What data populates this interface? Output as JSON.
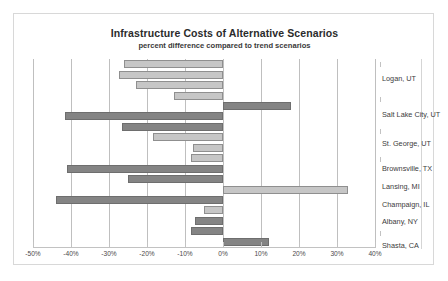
{
  "chart": {
    "title": "Infrastructure Costs of Alternative Scenarios",
    "subtitle": "percent difference compared to trend scenarios"
  },
  "chart_data": {
    "type": "bar",
    "orientation": "horizontal",
    "title": "Infrastructure Costs of Alternative Scenarios",
    "subtitle": "percent difference compared to trend scenarios",
    "xlabel": "",
    "ylabel": "",
    "xlim": [
      -50,
      40
    ],
    "xtick_labels": [
      "-50%",
      "-40%",
      "-30%",
      "-20%",
      "-10%",
      "0%",
      "10%",
      "20%",
      "30%",
      "40%"
    ],
    "xticks": [
      -50,
      -40,
      -30,
      -20,
      -10,
      0,
      10,
      20,
      30,
      40
    ],
    "grid": true,
    "legend": false,
    "categories": [
      "Logan, UT",
      "Salt Lake City, UT",
      "St. George, UT",
      "Brownsville, TX",
      "Lansing, MI",
      "Champaign, IL",
      "Albany, NY",
      "Shasta, CA"
    ],
    "bars": [
      {
        "value": -26.0,
        "style": "light"
      },
      {
        "value": -27.5,
        "style": "light"
      },
      {
        "value": -23.0,
        "style": "light"
      },
      {
        "value": -13.0,
        "style": "light"
      },
      {
        "value": 18.0,
        "style": "dark"
      },
      {
        "value": -41.5,
        "style": "dark"
      },
      {
        "value": -26.5,
        "style": "dark"
      },
      {
        "value": -18.5,
        "style": "light"
      },
      {
        "value": -8.0,
        "style": "light"
      },
      {
        "value": -8.5,
        "style": "light"
      },
      {
        "value": -41.0,
        "style": "dark"
      },
      {
        "value": -25.0,
        "style": "dark"
      },
      {
        "value": 33.0,
        "style": "light"
      },
      {
        "value": -44.0,
        "style": "dark"
      },
      {
        "value": -5.0,
        "style": "light"
      },
      {
        "value": -7.5,
        "style": "dark"
      },
      {
        "value": -8.5,
        "style": "dark"
      },
      {
        "value": 12.0,
        "style": "dark"
      }
    ],
    "colors": {
      "light_fill": "#c6c6c6",
      "light_border": "#8f8f8f",
      "dark_fill": "#848484",
      "dark_border": "#6e6e6e",
      "gridline": "#bfbfbf",
      "frame": "#d8d8d8",
      "text": "#3c3c3c"
    }
  }
}
